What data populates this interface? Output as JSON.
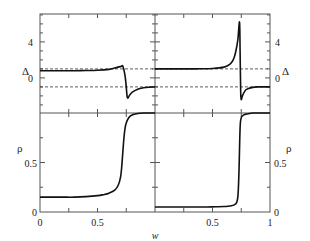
{
  "chart_data": {
    "type": "line",
    "layout": "2x2 panels sharing x-axis; top row Δ, bottom row ρ; left column and right column are two parameter cases",
    "xlabel": "w",
    "x_ticks": [
      "0",
      "0.5",
      "1"
    ],
    "left_x_ticks": [
      "0",
      "0.5"
    ],
    "right_x_ticks": [
      "0.5",
      "1"
    ],
    "xlim": [
      0,
      1
    ],
    "panels": [
      {
        "id": "top-left",
        "ylabel": "Δ",
        "y_ticks": [
          "0",
          "4"
        ],
        "ylim": [
          -3.9,
          7.1
        ],
        "reference_lines": [
          1,
          -1
        ],
        "series": [
          {
            "name": "Δ(w)",
            "x": [
              0,
              0.1,
              0.2,
              0.3,
              0.4,
              0.5,
              0.6,
              0.65,
              0.7,
              0.72,
              0.74,
              0.75,
              0.76,
              0.78,
              0.8,
              0.85,
              0.9,
              0.95,
              1.0
            ],
            "y": [
              0.8,
              0.8,
              0.8,
              0.8,
              0.82,
              0.85,
              0.95,
              1.1,
              1.25,
              1.3,
              0.2,
              -1.0,
              -2.2,
              -1.9,
              -1.6,
              -1.25,
              -1.1,
              -1.03,
              -1.0
            ]
          }
        ]
      },
      {
        "id": "top-right",
        "ylabel": "Δ",
        "y_ticks": [
          "0",
          "4"
        ],
        "ylim": [
          -3.9,
          7.1
        ],
        "reference_lines": [
          1,
          -1
        ],
        "series": [
          {
            "name": "Δ(w)",
            "x": [
              0,
              0.1,
              0.2,
              0.3,
              0.4,
              0.5,
              0.6,
              0.65,
              0.68,
              0.7,
              0.72,
              0.735,
              0.74,
              0.745,
              0.75,
              0.76,
              0.78,
              0.8,
              0.85,
              0.9,
              1.0
            ],
            "y": [
              1.0,
              1.0,
              1.0,
              1.0,
              1.02,
              1.05,
              1.2,
              1.5,
              2.0,
              2.8,
              4.2,
              6.2,
              3.0,
              -1.5,
              -2.4,
              -2.0,
              -1.5,
              -1.25,
              -1.05,
              -1.0,
              -1.0
            ]
          }
        ]
      },
      {
        "id": "bottom-left",
        "ylabel": "ρ",
        "y_ticks": [
          "0",
          "0.5"
        ],
        "ylim": [
          0,
          1
        ],
        "series": [
          {
            "name": "ρ(w)",
            "x": [
              0,
              0.1,
              0.2,
              0.3,
              0.4,
              0.5,
              0.55,
              0.6,
              0.65,
              0.68,
              0.7,
              0.71,
              0.72,
              0.73,
              0.74,
              0.75,
              0.77,
              0.8,
              0.85,
              0.9,
              1.0
            ],
            "y": [
              0.15,
              0.15,
              0.15,
              0.15,
              0.155,
              0.165,
              0.175,
              0.19,
              0.22,
              0.27,
              0.35,
              0.45,
              0.6,
              0.75,
              0.85,
              0.9,
              0.95,
              0.98,
              0.995,
              1.0,
              1.0
            ]
          }
        ]
      },
      {
        "id": "bottom-right",
        "ylabel": "ρ",
        "y_ticks": [
          "0",
          "0.5"
        ],
        "y_ticks_extra": [
          "1"
        ],
        "ylim": [
          0,
          1
        ],
        "series": [
          {
            "name": "ρ(w)",
            "x": [
              0,
              0.1,
              0.2,
              0.3,
              0.4,
              0.5,
              0.6,
              0.65,
              0.7,
              0.72,
              0.73,
              0.74,
              0.75,
              0.76,
              0.78,
              0.8,
              0.85,
              0.9,
              1.0
            ],
            "y": [
              0.05,
              0.05,
              0.05,
              0.05,
              0.05,
              0.052,
              0.055,
              0.06,
              0.08,
              0.15,
              0.4,
              0.85,
              0.95,
              0.97,
              0.985,
              0.99,
              1.0,
              1.0,
              1.0
            ]
          }
        ]
      }
    ],
    "grid": false,
    "legend": null
  },
  "labels": {
    "delta_left": "Δ",
    "delta_right": "Δ",
    "rho_left": "ρ",
    "rho_right": "ρ",
    "xlabel": "w",
    "tick_4_left": "4",
    "tick_0_delta_left": "0",
    "tick_4_right": "4",
    "tick_0_delta_right": "0",
    "tick_05_rho_left": "0.5",
    "tick_0_rho_left": "0",
    "tick_05_rho_right": "0.5",
    "tick_0_rho_right": "0",
    "xtick_0": "0",
    "xtick_05_left": "0.5",
    "xtick_05_right": "0.5",
    "xtick_1": "1"
  },
  "colors": {
    "frame": "#555555",
    "curve": "#111111",
    "dashed": "#333333"
  }
}
